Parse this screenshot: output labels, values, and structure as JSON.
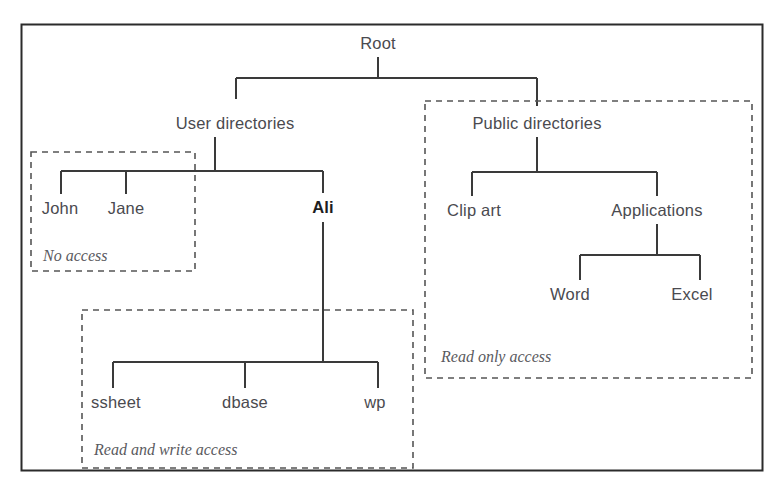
{
  "diagram": {
    "type": "tree",
    "outer_frame": {
      "visible": true,
      "color": "#2b2b2b"
    },
    "line_color": "#3a3a3a",
    "text_color": "#4a4a4f",
    "dashed_color": "#555555",
    "nodes": [
      {
        "id": "root",
        "label": "Root",
        "x": 378,
        "y": 43,
        "bold": false
      },
      {
        "id": "userdirs",
        "label": "User directories",
        "x": 235,
        "y": 123,
        "bold": false
      },
      {
        "id": "john",
        "label": "John",
        "x": 60,
        "y": 208,
        "bold": false
      },
      {
        "id": "jane",
        "label": "Jane",
        "x": 126,
        "y": 208,
        "bold": false
      },
      {
        "id": "ali",
        "label": "Ali",
        "x": 323,
        "y": 207,
        "bold": true
      },
      {
        "id": "ssheet",
        "label": "ssheet",
        "x": 116,
        "y": 402,
        "bold": false
      },
      {
        "id": "dbase",
        "label": "dbase",
        "x": 245,
        "y": 402,
        "bold": false
      },
      {
        "id": "wp",
        "label": "wp",
        "x": 375,
        "y": 402,
        "bold": false
      },
      {
        "id": "publicdirs",
        "label": "Public directories",
        "x": 537,
        "y": 123,
        "bold": false
      },
      {
        "id": "clipart",
        "label": "Clip art",
        "x": 474,
        "y": 210,
        "bold": false
      },
      {
        "id": "applications",
        "label": "Applications",
        "x": 657,
        "y": 210,
        "bold": false
      },
      {
        "id": "word",
        "label": "Word",
        "x": 570,
        "y": 294,
        "bold": false
      },
      {
        "id": "excel",
        "label": "Excel",
        "x": 692,
        "y": 294,
        "bold": false
      }
    ],
    "edges": [
      {
        "from": "root",
        "to": "userdirs"
      },
      {
        "from": "root",
        "to": "publicdirs"
      },
      {
        "from": "userdirs",
        "to": "john"
      },
      {
        "from": "userdirs",
        "to": "jane"
      },
      {
        "from": "userdirs",
        "to": "ali"
      },
      {
        "from": "ali",
        "to": "ssheet"
      },
      {
        "from": "ali",
        "to": "dbase"
      },
      {
        "from": "ali",
        "to": "wp"
      },
      {
        "from": "publicdirs",
        "to": "clipart"
      },
      {
        "from": "publicdirs",
        "to": "applications"
      },
      {
        "from": "applications",
        "to": "word"
      },
      {
        "from": "applications",
        "to": "excel"
      }
    ],
    "zones": [
      {
        "id": "no-access",
        "caption": "No access",
        "caption_x": 43,
        "caption_y": 256,
        "box": {
          "x": 31,
          "y": 152,
          "w": 164,
          "h": 119
        },
        "covers": [
          "John",
          "Jane"
        ]
      },
      {
        "id": "read-write-access",
        "caption": "Read and write access",
        "caption_x": 94,
        "caption_y": 450,
        "box": {
          "x": 82,
          "y": 310,
          "w": 331,
          "h": 158
        },
        "covers": [
          "ssheet",
          "dbase",
          "wp"
        ]
      },
      {
        "id": "read-only-access",
        "caption": "Read only access",
        "caption_x": 441,
        "caption_y": 357,
        "box": {
          "x": 425,
          "y": 101,
          "w": 327,
          "h": 277
        },
        "covers": [
          "Public directories",
          "Clip art",
          "Applications",
          "Word",
          "Excel"
        ]
      }
    ]
  }
}
